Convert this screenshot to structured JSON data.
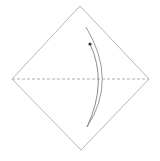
{
  "diagram": {
    "type": "origami-step",
    "paper": {
      "shape": "square-diamond",
      "vertices": {
        "top": [
          80,
          6
        ],
        "right": [
          149,
          79
        ],
        "bottom": [
          81,
          150
        ],
        "left": [
          12,
          79
        ]
      },
      "stroke_color": "#b8b8b8"
    },
    "fold_line": {
      "style": "valley-dashed",
      "from": [
        12,
        79
      ],
      "to": [
        149,
        79
      ],
      "stroke_color": "#b0b0b0"
    },
    "arrow": {
      "kind": "fold-arrow",
      "direction": "bottom-to-top",
      "outer_arc_color": "#9a9a9a",
      "inner_arc_color": "#8a8a8a",
      "head_color": "#333333"
    }
  }
}
